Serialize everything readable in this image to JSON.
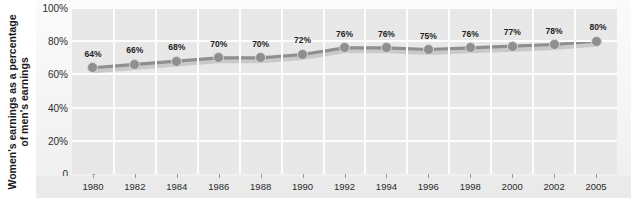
{
  "chart_data": {
    "type": "line",
    "title": "",
    "xlabel": "",
    "ylabel_line1": "Women's earnings as a percentage",
    "ylabel_line2": "of men's earnings",
    "categories": [
      "1980",
      "1982",
      "1984",
      "1986",
      "1988",
      "1990",
      "1992",
      "1994",
      "1996",
      "1998",
      "2000",
      "2002",
      "2005"
    ],
    "values": [
      64,
      66,
      68,
      70,
      70,
      72,
      76,
      76,
      75,
      76,
      77,
      78,
      80
    ],
    "point_labels": [
      "64%",
      "66%",
      "68%",
      "70%",
      "70%",
      "72%",
      "76%",
      "76%",
      "75%",
      "76%",
      "77%",
      "78%",
      "80%"
    ],
    "ylim": [
      0,
      100
    ],
    "ytick_values": [
      0,
      20,
      40,
      60,
      80,
      100
    ],
    "ytick_labels": [
      "0",
      "20%",
      "40%",
      "60%",
      "80%",
      "100%"
    ],
    "grid": true,
    "legend": "none",
    "series_color": "#8f8f8f",
    "plot_background": "#e8e8e8",
    "gridline_color": "#fdfdfd"
  }
}
